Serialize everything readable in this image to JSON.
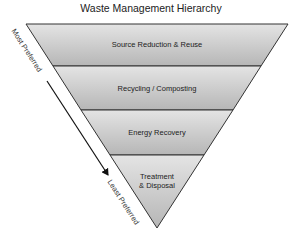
{
  "title": "Waste Management Hierarchy",
  "levels": [
    {
      "label": "Source Reduction & Reuse"
    },
    {
      "label": "Recycling / Composting"
    },
    {
      "label": "Energy Recovery"
    },
    {
      "label_line1": "Treatment",
      "label_line2": "& Disposal"
    }
  ],
  "axis": {
    "top_label": "Most Preferred",
    "bottom_label": "Least Preferred",
    "direction": "arrow-down"
  },
  "colors": {
    "band_top": "#e2e2e2",
    "band_bottom": "#b5b5b5",
    "outline": "#333333"
  }
}
